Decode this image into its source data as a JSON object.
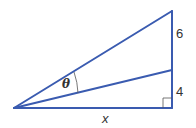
{
  "diagram": {
    "type": "right-triangle-angle",
    "line_color": "#3355aa",
    "labels": {
      "angle": "θ",
      "upper_segment": "6",
      "lower_segment": "4",
      "base": "x"
    }
  }
}
